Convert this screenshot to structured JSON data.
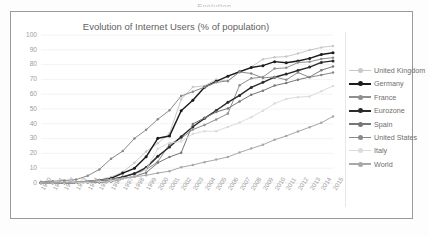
{
  "page": {
    "clipped_header_text": "Evolution"
  },
  "chart": {
    "title": "Evolution of Internet Users (% of population)"
  },
  "legend": {
    "position": "right",
    "entries": [
      {
        "label": "United Kingdom",
        "color": "#c9c9c9"
      },
      {
        "label": "Germany",
        "color": "#1b1b1b"
      },
      {
        "label": "France",
        "color": "#8f8f8f"
      },
      {
        "label": "Eurozone",
        "color": "#2b2b2b"
      },
      {
        "label": "Spain",
        "color": "#777777"
      },
      {
        "label": "United States",
        "color": "#8a8a8a"
      },
      {
        "label": "Italy",
        "color": "#dcdcdc"
      },
      {
        "label": "World",
        "color": "#a8a8a8"
      }
    ]
  },
  "axes": {
    "y_ticks": [
      "100",
      "90",
      "80",
      "70",
      "60",
      "50",
      "40",
      "30",
      "20",
      "10",
      "0"
    ],
    "x_ticks": [
      "1990",
      "1991",
      "1992",
      "1993",
      "1994",
      "1995",
      "1996",
      "1997",
      "1998",
      "1999",
      "2000",
      "2001",
      "2002",
      "2003",
      "2004",
      "2005",
      "2006",
      "2007",
      "2008",
      "2009",
      "2010",
      "2011",
      "2012",
      "2013",
      "2014",
      "2015"
    ]
  },
  "chart_data": {
    "type": "line",
    "title": "Evolution of Internet Users (% of population)",
    "xlabel": "",
    "ylabel": "",
    "ylim": [
      0,
      100
    ],
    "xlim": [
      "1990",
      "2015"
    ],
    "grid": true,
    "legend_position": "right",
    "markers": true,
    "x": [
      "1990",
      "1991",
      "1992",
      "1993",
      "1994",
      "1995",
      "1996",
      "1997",
      "1998",
      "1999",
      "2000",
      "2001",
      "2002",
      "2003",
      "2004",
      "2005",
      "2006",
      "2007",
      "2008",
      "2009",
      "2010",
      "2011",
      "2012",
      "2013",
      "2014",
      "2015"
    ],
    "series": [
      {
        "name": "United Kingdom",
        "color": "#c9c9c9",
        "values": [
          0.1,
          0.1,
          0.2,
          0.3,
          0.9,
          1.9,
          4.1,
          7.4,
          13.7,
          21.3,
          26.8,
          33.5,
          56.5,
          64.8,
          65.6,
          70.0,
          68.8,
          75.1,
          78.4,
          83.6,
          85.0,
          85.4,
          87.5,
          89.8,
          91.6,
          92.6
        ],
        "last_value": 92.6
      },
      {
        "name": "Germany",
        "color": "#1b1b1b",
        "values": [
          0.1,
          0.1,
          0.2,
          0.3,
          1.0,
          1.8,
          3.1,
          6.7,
          9.9,
          17.7,
          30.2,
          31.7,
          48.8,
          55.9,
          64.7,
          68.7,
          72.2,
          75.2,
          78.0,
          79.3,
          82.0,
          81.3,
          82.4,
          84.2,
          86.8,
          88.0
        ],
        "last_value": 88.0
      },
      {
        "name": "France",
        "color": "#8f8f8f",
        "values": [
          0.1,
          0.1,
          0.2,
          0.3,
          0.8,
          1.6,
          2.6,
          4.0,
          6.3,
          9.1,
          14.3,
          26.3,
          30.2,
          36.1,
          39.2,
          42.9,
          46.9,
          66.1,
          70.7,
          71.6,
          77.3,
          77.8,
          81.4,
          81.9,
          83.8,
          84.7
        ],
        "last_value": 84.7
      },
      {
        "name": "Eurozone",
        "color": "#2b2b2b",
        "values": [
          0.1,
          0.1,
          0.2,
          0.3,
          0.7,
          1.4,
          2.3,
          4.1,
          6.4,
          10.4,
          18.0,
          24.3,
          31.3,
          38.0,
          43.7,
          49.0,
          54.5,
          59.2,
          64.6,
          68.0,
          71.5,
          73.6,
          76.0,
          78.3,
          81.5,
          82.5
        ],
        "last_value": 82.5
      },
      {
        "name": "Spain",
        "color": "#777777",
        "values": [
          0.1,
          0.1,
          0.2,
          0.3,
          0.4,
          0.4,
          1.0,
          2.8,
          4.5,
          7.0,
          13.6,
          17.6,
          20.4,
          39.9,
          44.0,
          47.9,
          50.4,
          55.1,
          59.6,
          62.4,
          65.8,
          67.6,
          69.8,
          71.6,
          76.2,
          78.7
        ],
        "last_value": 78.7
      },
      {
        "name": "United States",
        "color": "#8a8a8a",
        "values": [
          0.8,
          1.2,
          1.7,
          2.3,
          4.9,
          9.2,
          16.4,
          21.6,
          30.1,
          35.9,
          43.1,
          49.1,
          58.8,
          61.7,
          64.8,
          68.0,
          69.0,
          75.0,
          74.0,
          71.0,
          71.7,
          69.7,
          74.7,
          71.4,
          73.0,
          74.6
        ],
        "last_value": 74.6
      },
      {
        "name": "Italy",
        "color": "#dcdcdc",
        "values": [
          0.0,
          0.0,
          0.1,
          0.2,
          0.5,
          1.0,
          1.5,
          2.9,
          4.4,
          9.3,
          23.1,
          27.2,
          28.0,
          33.2,
          35.0,
          35.0,
          37.9,
          40.8,
          44.5,
          48.8,
          53.7,
          56.8,
          58.0,
          58.5,
          62.0,
          65.6
        ],
        "last_value": 65.6
      },
      {
        "name": "World",
        "color": "#a8a8a8",
        "values": [
          0.1,
          0.3,
          0.5,
          0.8,
          1.2,
          1.8,
          2.5,
          3.4,
          4.2,
          5.2,
          6.7,
          8.0,
          10.6,
          12.2,
          14.1,
          15.8,
          17.6,
          20.6,
          23.3,
          25.8,
          29.2,
          31.8,
          34.8,
          37.7,
          40.7,
          45.0
        ],
        "last_value": 45.0
      }
    ]
  },
  "colors": {
    "frame_border": "#9a9a9a",
    "plot_background": "#ffffff",
    "gridline": "#eeeeee",
    "axis_text": "#9d9d9d",
    "title_text": "#5f5f5f"
  }
}
